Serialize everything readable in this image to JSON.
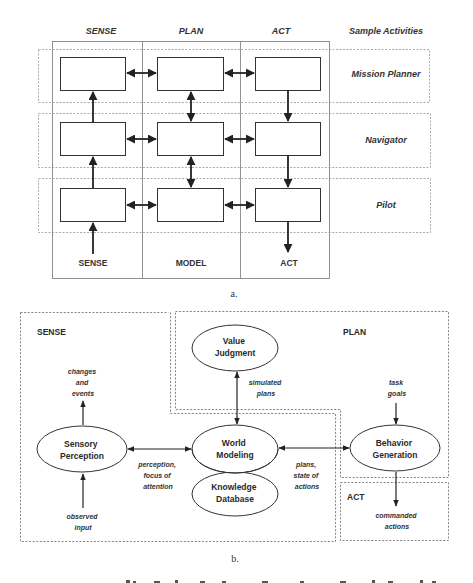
{
  "figure_a": {
    "columns": [
      "SENSE",
      "PLAN",
      "ACT"
    ],
    "sample_activities_header": "Sample Activities",
    "rows": [
      "Mission Planner",
      "Navigator",
      "Pilot"
    ],
    "bottom_labels": [
      "SENSE",
      "MODEL",
      "ACT"
    ],
    "caption": "a."
  },
  "figure_b": {
    "sections": {
      "sense": "SENSE",
      "plan": "PLAN",
      "act": "ACT"
    },
    "nodes": {
      "value_judgment": [
        "Value",
        "Judgment"
      ],
      "sensory_perception": [
        "Sensory",
        "Perception"
      ],
      "world_modeling": [
        "World",
        "Modeling"
      ],
      "knowledge_database": [
        "Knowledge",
        "Database"
      ],
      "behavior_generation": [
        "Behavior",
        "Generation"
      ]
    },
    "annotations": {
      "changes_events": [
        "changes",
        "and",
        "events"
      ],
      "observed_input": [
        "observed",
        "input"
      ],
      "simulated_plans": [
        "simulated",
        "plans"
      ],
      "perception_focus": [
        "perception,",
        "focus of",
        "attention"
      ],
      "plans_state": [
        "plans,",
        "state of",
        "actions"
      ],
      "task_goals": [
        "task",
        "goals"
      ],
      "commanded_actions": [
        "commanded",
        "actions"
      ]
    },
    "caption": "b."
  }
}
